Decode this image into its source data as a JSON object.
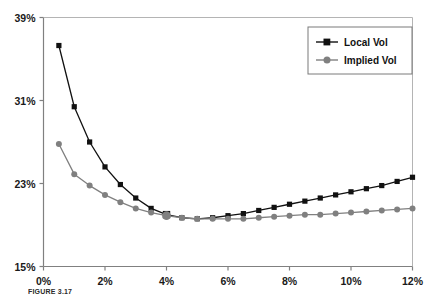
{
  "chart_data": {
    "type": "line",
    "title": "",
    "xlabel": "",
    "ylabel": "",
    "xlim": [
      0,
      12
    ],
    "ylim": [
      15,
      39
    ],
    "grid": false,
    "legend_position": "top-right",
    "xticks": [
      "0%",
      "2%",
      "4%",
      "6%",
      "8%",
      "10%",
      "12%"
    ],
    "xtick_values": [
      0,
      2,
      4,
      6,
      8,
      10,
      12
    ],
    "yticks": [
      "15%",
      "23%",
      "31%",
      "39%"
    ],
    "ytick_values": [
      15,
      23,
      31,
      39
    ],
    "x": [
      0.5,
      1.0,
      1.5,
      2.0,
      2.5,
      3.0,
      3.5,
      4.0,
      4.5,
      5.0,
      5.5,
      6.0,
      6.5,
      7.0,
      7.5,
      8.0,
      8.5,
      9.0,
      9.5,
      10.0,
      10.5,
      11.0,
      11.5,
      12.0
    ],
    "series": [
      {
        "name": "Local Vol",
        "color": "#111111",
        "marker": "square",
        "values": [
          36.3,
          30.4,
          27.0,
          24.6,
          22.9,
          21.6,
          20.6,
          20.0,
          19.7,
          19.6,
          19.7,
          19.9,
          20.1,
          20.4,
          20.7,
          21.0,
          21.3,
          21.6,
          21.9,
          22.2,
          22.5,
          22.8,
          23.2,
          23.6
        ],
        "emphasis_index": 7
      },
      {
        "name": "Implied Vol",
        "color": "#808080",
        "marker": "circle",
        "values": [
          26.8,
          23.9,
          22.8,
          21.9,
          21.2,
          20.6,
          20.2,
          19.9,
          19.7,
          19.6,
          19.6,
          19.6,
          19.6,
          19.7,
          19.8,
          19.9,
          20.0,
          20.0,
          20.1,
          20.2,
          20.3,
          20.4,
          20.5,
          20.6
        ],
        "emphasis_index": 7
      }
    ],
    "legend": [
      {
        "label": "Local Vol",
        "color": "#111111",
        "marker": "square"
      },
      {
        "label": "Implied Vol",
        "color": "#808080",
        "marker": "circle"
      }
    ]
  },
  "caption": {
    "figure_number": "FIGURE 3.17"
  }
}
